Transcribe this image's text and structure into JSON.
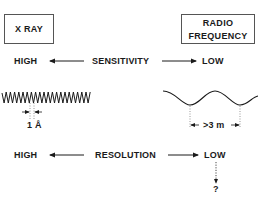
{
  "boxes": {
    "left": "X RAY",
    "right_line1": "RADIO",
    "right_line2": "FREQUENCY"
  },
  "sensitivity_row": {
    "left": "HIGH",
    "center": "SENSITIVITY",
    "right": "LOW"
  },
  "wavelengths": {
    "xray_label": "1 Å",
    "radio_label": ">3 m"
  },
  "resolution_row": {
    "left": "HIGH",
    "center": "RESOLUTION",
    "right": "LOW",
    "question": "?"
  }
}
